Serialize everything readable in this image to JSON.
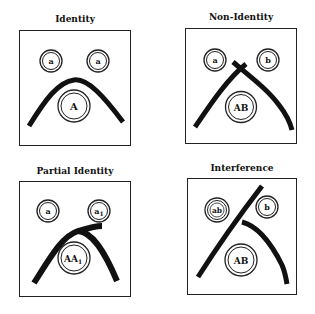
{
  "figure": {
    "panels": [
      {
        "id": "identity",
        "title": "Identity",
        "wells": [
          {
            "label": "a",
            "role": "antibody-well-left"
          },
          {
            "label": "a",
            "role": "antibody-well-right"
          },
          {
            "label": "A",
            "role": "antigen-well-center"
          }
        ],
        "pattern": "smooth continuous arc (lines fuse)"
      },
      {
        "id": "non-identity",
        "title": "Non-Identity",
        "wells": [
          {
            "label": "a",
            "role": "antibody-well-left"
          },
          {
            "label": "b",
            "role": "antibody-well-right"
          },
          {
            "label": "AB",
            "role": "antigen-well-center"
          }
        ],
        "pattern": "two lines crossing at apex"
      },
      {
        "id": "partial-identity",
        "title": "Partial Identity",
        "wells": [
          {
            "label": "a",
            "role": "antibody-well-left"
          },
          {
            "label": "a",
            "sub": "1",
            "role": "antibody-well-right"
          },
          {
            "label": "AA",
            "sub": "1",
            "role": "antigen-well-center"
          }
        ],
        "pattern": "arc with spur extending toward right well"
      },
      {
        "id": "interference",
        "title": "Interference",
        "wells": [
          {
            "label": "ab",
            "role": "antibody-well-left"
          },
          {
            "label": "b",
            "role": "antibody-well-right"
          },
          {
            "label": "AB",
            "role": "antigen-well-center"
          }
        ],
        "pattern": "one line continues through, second line stops at the first"
      }
    ]
  }
}
